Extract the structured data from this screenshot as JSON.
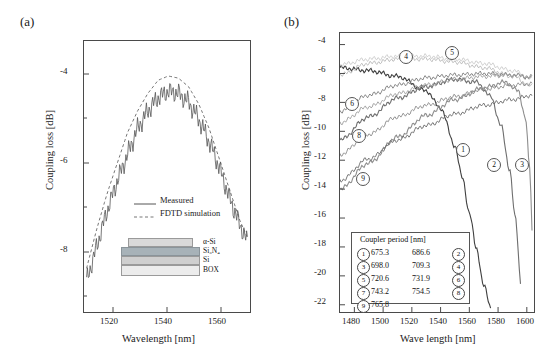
{
  "figure": {
    "panel_a_label": "(a)",
    "panel_b_label": "(b)"
  },
  "panel_a": {
    "xlabel": "Wavelength [nm]",
    "ylabel": "Coupling loss [dB]",
    "xticks": [
      "1520",
      "1540",
      "1560"
    ],
    "yticks": [
      "-4",
      "-6",
      "-8"
    ],
    "legend": [
      {
        "label": "Measured",
        "style": "solid"
      },
      {
        "label": "FDTD simulation",
        "style": "dashed"
      }
    ],
    "stack": [
      {
        "label": "α-Si",
        "color": "#d4d4d4"
      },
      {
        "label": "Si₃N₄",
        "color": "#9aa7ae"
      },
      {
        "label": "Si",
        "color": "#c8c8c8"
      },
      {
        "label": "BOX",
        "color": "#e6e6e6"
      }
    ]
  },
  "panel_b": {
    "xlabel": "Wave length [nm]",
    "ylabel": "Coupling loss [dB]",
    "xticks": [
      "1480",
      "1500",
      "1520",
      "1540",
      "1560",
      "1580",
      "1600"
    ],
    "yticks": [
      "-4",
      "-6",
      "-8",
      "-10",
      "-12",
      "-14",
      "-16",
      "-18",
      "-20",
      "-22"
    ],
    "legend_title": "Coupler period [nm]",
    "legend_entries": [
      {
        "num": "1",
        "value": "675.3"
      },
      {
        "num": "2",
        "value": "686.6"
      },
      {
        "num": "3",
        "value": "698.0"
      },
      {
        "num": "4",
        "value": "709.3"
      },
      {
        "num": "5",
        "value": "720.6"
      },
      {
        "num": "6",
        "value": "731.9"
      },
      {
        "num": "7",
        "value": "743.2"
      },
      {
        "num": "8",
        "value": "754.5"
      },
      {
        "num": "9",
        "value": "765.8"
      }
    ],
    "curve_markers": [
      "1",
      "2",
      "3",
      "4",
      "5",
      "6",
      "8",
      "9"
    ]
  },
  "chart_data": [
    {
      "type": "line",
      "title": "(a) Measured vs FDTD coupling loss",
      "xlabel": "Wavelength [nm]",
      "ylabel": "Coupling loss [dB]",
      "xlim": [
        1507,
        1572
      ],
      "ylim": [
        -9,
        -2.8
      ],
      "xticks": [
        1520,
        1540,
        1560
      ],
      "yticks": [
        -4,
        -6,
        -8
      ],
      "grid": false,
      "legend_position": "inside-lower-center",
      "series": [
        {
          "name": "Measured",
          "style": "solid",
          "note": "noisy trace with fast ripple",
          "x": [
            1508,
            1512,
            1516,
            1520,
            1524,
            1528,
            1532,
            1536,
            1540,
            1544,
            1548,
            1552,
            1556,
            1560,
            1564,
            1568,
            1571
          ],
          "values": [
            -8.3,
            -7.5,
            -6.7,
            -6.0,
            -5.4,
            -4.8,
            -4.4,
            -4.1,
            -3.95,
            -4.0,
            -4.2,
            -4.6,
            -5.1,
            -5.7,
            -6.4,
            -7.0,
            -7.4
          ]
        },
        {
          "name": "FDTD simulation",
          "style": "dashed",
          "x": [
            1508,
            1512,
            1516,
            1520,
            1524,
            1528,
            1532,
            1536,
            1540,
            1544,
            1548,
            1552,
            1556,
            1560,
            1564,
            1568,
            1571
          ],
          "values": [
            -8.0,
            -7.1,
            -6.3,
            -5.6,
            -4.9,
            -4.4,
            -4.0,
            -3.7,
            -3.6,
            -3.65,
            -3.85,
            -4.25,
            -4.8,
            -5.5,
            -6.2,
            -6.9,
            -7.3
          ]
        }
      ]
    },
    {
      "type": "line",
      "title": "(b) Coupling loss vs wavelength for different coupler periods",
      "xlabel": "Wave length [nm]",
      "ylabel": "Coupling loss [dB]",
      "xlim": [
        1470,
        1605
      ],
      "ylim": [
        -22.5,
        -3.2
      ],
      "xticks": [
        1480,
        1500,
        1520,
        1540,
        1560,
        1580,
        1600
      ],
      "yticks": [
        -4,
        -6,
        -8,
        -10,
        -12,
        -14,
        -16,
        -18,
        -20,
        -22
      ],
      "grid": false,
      "legend_position": "inside-lower-left",
      "legend_title": "Coupler period [nm]",
      "series": [
        {
          "name": "1",
          "period_nm": 675.3,
          "x": [
            1470,
            1490,
            1510,
            1530,
            1540,
            1550,
            1555,
            1560,
            1565,
            1570,
            1575
          ],
          "values": [
            -5.6,
            -5.8,
            -6.2,
            -7.2,
            -8.4,
            -11.0,
            -13.2,
            -15.6,
            -18.2,
            -20.6,
            -22.3
          ]
        },
        {
          "name": "2",
          "period_nm": 686.6,
          "x": [
            1470,
            1490,
            1510,
            1530,
            1550,
            1565,
            1575,
            1582,
            1588,
            1592,
            1596
          ],
          "values": [
            -10.6,
            -9.0,
            -7.7,
            -6.9,
            -6.4,
            -6.6,
            -7.6,
            -9.6,
            -12.6,
            -16.0,
            -20.6
          ]
        },
        {
          "name": "3",
          "period_nm": 698.0,
          "x": [
            1470,
            1490,
            1510,
            1530,
            1550,
            1570,
            1585,
            1594,
            1599,
            1602,
            1604
          ],
          "values": [
            -14.0,
            -12.2,
            -10.4,
            -8.9,
            -7.8,
            -7.0,
            -6.6,
            -7.2,
            -9.0,
            -12.5,
            -17.5
          ]
        },
        {
          "name": "4",
          "period_nm": 709.3,
          "x": [
            1470,
            1490,
            1510,
            1530,
            1550,
            1570,
            1590,
            1604
          ],
          "values": [
            -6.1,
            -5.3,
            -5.0,
            -5.0,
            -5.2,
            -5.6,
            -6.2,
            -6.9
          ]
        },
        {
          "name": "5",
          "period_nm": 720.6,
          "x": [
            1470,
            1490,
            1510,
            1530,
            1550,
            1570,
            1590,
            1604
          ],
          "values": [
            -5.4,
            -5.0,
            -4.8,
            -4.8,
            -5.0,
            -5.3,
            -5.8,
            -6.4
          ]
        },
        {
          "name": "6",
          "period_nm": 731.9,
          "x": [
            1470,
            1490,
            1510,
            1530,
            1550,
            1570,
            1590,
            1604
          ],
          "values": [
            -8.6,
            -7.5,
            -6.8,
            -6.3,
            -6.1,
            -6.0,
            -6.1,
            -6.3
          ]
        },
        {
          "name": "7",
          "period_nm": 743.2,
          "x": [
            1470,
            1490,
            1510,
            1530,
            1550,
            1570,
            1590,
            1604
          ],
          "values": [
            -9.4,
            -8.3,
            -7.4,
            -6.8,
            -6.4,
            -6.2,
            -6.1,
            -6.2
          ]
        },
        {
          "name": "8",
          "period_nm": 754.5,
          "x": [
            1470,
            1490,
            1510,
            1530,
            1550,
            1570,
            1590,
            1604
          ],
          "values": [
            -11.6,
            -10.2,
            -9.0,
            -8.2,
            -7.6,
            -7.1,
            -6.8,
            -6.7
          ]
        },
        {
          "name": "9",
          "period_nm": 765.8,
          "x": [
            1470,
            1490,
            1510,
            1530,
            1550,
            1570,
            1590,
            1604
          ],
          "values": [
            -13.4,
            -11.9,
            -10.6,
            -9.6,
            -8.8,
            -8.2,
            -7.8,
            -7.5
          ]
        }
      ]
    }
  ]
}
